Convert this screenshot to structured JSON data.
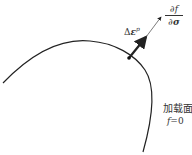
{
  "diagram": {
    "type": "yield-surface-normality",
    "labels": {
      "gradient_numerator": "∂f",
      "gradient_denominator_symbol": "∂",
      "gradient_denominator_var": "σ",
      "plastic_strain_delta": "Δ",
      "plastic_strain_var": "ε",
      "plastic_strain_sup": "p",
      "surface_name": "加载面",
      "surface_equation_var": "f",
      "surface_equation_rest": "=0"
    },
    "colors": {
      "curve": "#222222",
      "text": "#333333",
      "background": "#ffffff"
    },
    "curve_path": "M3,83 C30,55 60,38 90,41 C115,43 135,55 145,70 C157,88 152,120 143,152",
    "point": {
      "x": 129,
      "y": 58
    },
    "arrow": {
      "from": [
        129,
        58
      ],
      "thick_to": [
        146,
        37
      ],
      "to": [
        161,
        16
      ]
    }
  }
}
